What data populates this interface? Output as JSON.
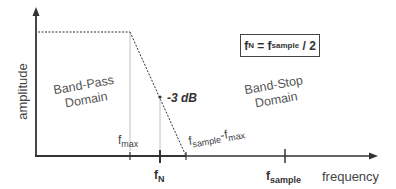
{
  "diagram": {
    "y_axis_label": "amplitude",
    "x_axis_label": "frequency",
    "formula": {
      "f": "f",
      "n_sub": "N",
      "eq": " = f",
      "sample_sub": "sample",
      "tail": " / 2"
    },
    "annotation_3db": "-3 dB",
    "regions": {
      "band_pass_line1": "Band-Pass",
      "band_pass_line2": "Domain",
      "band_stop_line1": "Band-Stop",
      "band_stop_line2": "Domain"
    },
    "ticks": {
      "fmax": {
        "f": "f",
        "sub": "max"
      },
      "fn": {
        "f": "f",
        "sub": "N"
      },
      "fsample_minus_fmax": {
        "f1": "f",
        "sub1": "sample",
        "dash": "-f",
        "sub2": "max"
      },
      "fsample": {
        "f": "f",
        "sub": "sample"
      }
    },
    "colors": {
      "axis": "#333333",
      "guide": "#b0b0b0",
      "dotted": "#333333"
    }
  }
}
